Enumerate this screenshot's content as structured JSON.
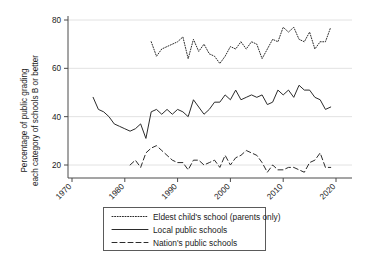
{
  "chart_data": {
    "type": "line",
    "title": "",
    "xlabel": "",
    "ylabel": "Percentage of public grading each category of schools B or better",
    "ylabel_line1": "Percentage of public grading",
    "ylabel_line2": "each category of schools B or better",
    "xlim": [
      1970,
      2022
    ],
    "ylim": [
      14,
      82
    ],
    "yticks": [
      20,
      40,
      60,
      80
    ],
    "xticks": [
      1970,
      1980,
      1990,
      2000,
      2010,
      2020
    ],
    "grid": "horizontal",
    "legend_position": "below-center",
    "series": [
      {
        "name": "Eldest child's school (parents only)",
        "style": "dotted",
        "color": "#2b2b2b",
        "x": [
          1985,
          1986,
          1987,
          1988,
          1989,
          1990,
          1991,
          1992,
          1993,
          1994,
          1995,
          1996,
          1997,
          1998,
          1999,
          2000,
          2001,
          2002,
          2003,
          2004,
          2005,
          2006,
          2007,
          2008,
          2009,
          2010,
          2011,
          2012,
          2013,
          2014,
          2015,
          2016,
          2017,
          2018,
          2019
        ],
        "values": [
          71,
          65,
          68,
          69,
          70,
          71,
          73,
          64,
          72,
          67,
          70,
          66,
          65,
          62,
          65,
          69,
          68,
          71,
          68,
          71,
          70,
          64,
          68,
          72,
          71,
          77,
          75,
          77,
          72,
          71,
          75,
          68,
          71,
          71,
          77
        ]
      },
      {
        "name": "Local public schools",
        "style": "solid",
        "color": "#2b2b2b",
        "x": [
          1974,
          1975,
          1976,
          1977,
          1978,
          1979,
          1980,
          1981,
          1982,
          1983,
          1984,
          1985,
          1986,
          1987,
          1988,
          1989,
          1990,
          1991,
          1992,
          1993,
          1994,
          1995,
          1996,
          1997,
          1998,
          1999,
          2000,
          2001,
          2002,
          2003,
          2004,
          2005,
          2006,
          2007,
          2008,
          2009,
          2010,
          2011,
          2012,
          2013,
          2014,
          2015,
          2016,
          2017,
          2018,
          2019
        ],
        "values": [
          48,
          43,
          42,
          40,
          37,
          36,
          35,
          34,
          35,
          37,
          31,
          42,
          43,
          41,
          43,
          41,
          43,
          42,
          40,
          47,
          44,
          41,
          43,
          46,
          46,
          49,
          47,
          51,
          47,
          48,
          49,
          48,
          49,
          45,
          46,
          51,
          49,
          51,
          48,
          53,
          51,
          51,
          48,
          47,
          43,
          44
        ]
      },
      {
        "name": "Nation's public schools",
        "style": "dashed",
        "color": "#2b2b2b",
        "x": [
          1981,
          1982,
          1983,
          1984,
          1985,
          1986,
          1987,
          1988,
          1989,
          1990,
          1991,
          1992,
          1993,
          1994,
          1995,
          1996,
          1997,
          1998,
          1999,
          2000,
          2001,
          2002,
          2003,
          2004,
          2005,
          2006,
          2007,
          2008,
          2009,
          2010,
          2011,
          2012,
          2013,
          2014,
          2015,
          2016,
          2017,
          2018,
          2019
        ],
        "values": [
          20,
          22,
          19,
          25,
          27,
          28,
          26,
          24,
          22,
          21,
          21,
          18,
          22,
          22,
          20,
          21,
          22,
          19,
          24,
          20,
          23,
          24,
          26,
          25,
          24,
          21,
          17,
          20,
          18,
          18,
          19,
          19,
          18,
          17,
          21,
          22,
          25,
          19,
          19
        ]
      }
    ]
  },
  "legend": {
    "items": [
      {
        "label": "Eldest child's school (parents only)",
        "style": "dotted"
      },
      {
        "label": "Local public schools",
        "style": "solid"
      },
      {
        "label": "Nation's public schools",
        "style": "dashed"
      }
    ]
  },
  "axes": {
    "ytick_labels": [
      "20",
      "40",
      "60",
      "80"
    ],
    "xtick_labels": [
      "1970",
      "1980",
      "1990",
      "2000",
      "2010",
      "2020"
    ]
  }
}
